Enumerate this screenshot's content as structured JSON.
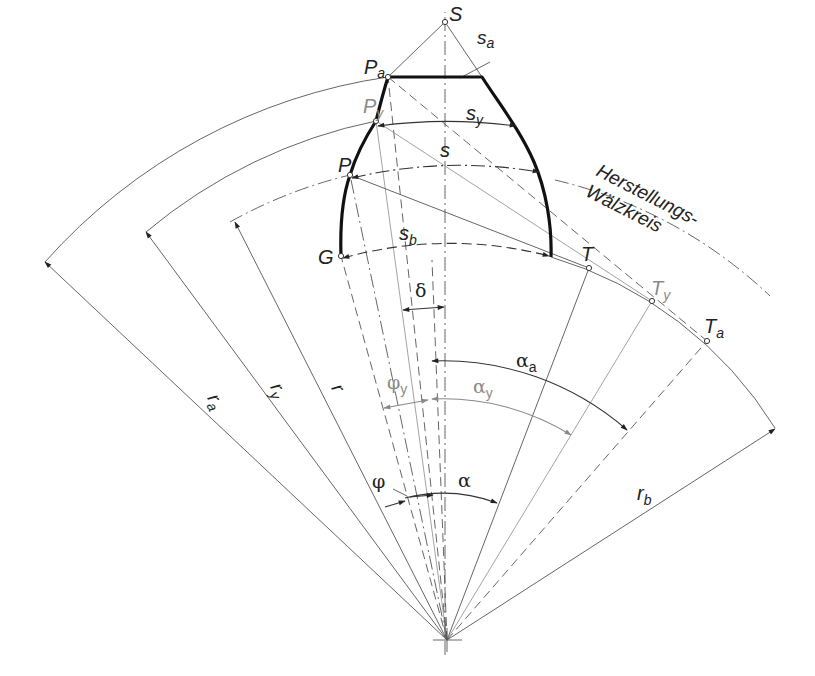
{
  "labels": {
    "S": "S",
    "s_a_main": "s",
    "s_a_sub": "a",
    "P_a_main": "P",
    "P_a_sub": "a",
    "P_y_main": "P",
    "P_y_sub": "y",
    "P": "P",
    "G": "G",
    "s_y_main": "s",
    "s_y_sub": "y",
    "s": "s",
    "s_b_main": "s",
    "s_b_sub": "b",
    "T": "T",
    "T_y_main": "T",
    "T_y_sub": "y",
    "T_a_main": "T",
    "T_a_sub": "a",
    "delta": "δ",
    "alpha_a_main": "α",
    "alpha_a_sub": "a",
    "alpha_y_main": "α",
    "alpha_y_sub": "y",
    "phi_y_main": "φ",
    "phi_y_sub": "y",
    "phi": "φ",
    "alpha": "α",
    "r_a_main": "r",
    "r_a_sub": "a",
    "r_y_main": "r",
    "r_y_sub": "y",
    "r": "r",
    "r_b_main": "r",
    "r_b_sub": "b",
    "circle_label_line1": "Herstellungs-",
    "circle_label_line2": "Wälzkreis"
  },
  "colors": {
    "line": "#555555",
    "profile": "#111111",
    "secondary": "#8a8a8a",
    "background": "#ffffff"
  }
}
